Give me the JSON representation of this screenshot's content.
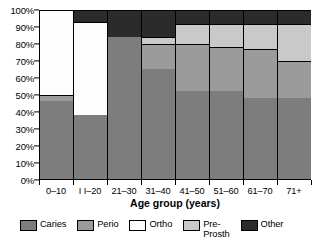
{
  "chart_data": {
    "type": "bar",
    "subtype": "stacked-percentage",
    "title": "",
    "xlabel": "Age group (years)",
    "ylabel": "",
    "categories": [
      "0–10",
      "I I–20",
      "21–30",
      "31–40",
      "41–50",
      "51–60",
      "61–70",
      "71+"
    ],
    "ylim": [
      0,
      100
    ],
    "ytick_labels": [
      "0%",
      "10%",
      "20%",
      "30%",
      "40%",
      "50%",
      "60%",
      "70%",
      "80%",
      "90%",
      "100%"
    ],
    "ytick_values": [
      0,
      10,
      20,
      30,
      40,
      50,
      60,
      70,
      80,
      90,
      100
    ],
    "grid": false,
    "legend_position": "bottom",
    "series": [
      {
        "name": "Caries",
        "color": "#7d7d7d",
        "values": [
          46,
          38,
          84,
          65,
          52,
          52,
          48,
          48
        ]
      },
      {
        "name": "Perio",
        "color": "#9b9b9b",
        "values": [
          4,
          0,
          0,
          15,
          28,
          26,
          29,
          22
        ]
      },
      {
        "name": "Ortho",
        "color": "#fdfdfd",
        "values": [
          50,
          55,
          0,
          0,
          0,
          0,
          0,
          0
        ]
      },
      {
        "name": "Pre-Prosth",
        "color": "#c9c9c9",
        "values": [
          0,
          0,
          0,
          4,
          12,
          14,
          15,
          22
        ]
      },
      {
        "name": "Other",
        "color": "#2b2b2b",
        "values": [
          0,
          7,
          16,
          16,
          8,
          8,
          8,
          8
        ]
      }
    ]
  },
  "legend": {
    "items": [
      {
        "label": "Caries",
        "color": "#7d7d7d"
      },
      {
        "label": "Perio",
        "color": "#9b9b9b"
      },
      {
        "label": "Ortho",
        "color": "#fdfdfd"
      },
      {
        "label": "Pre-\nProsth",
        "color": "#c9c9c9"
      },
      {
        "label": "Other",
        "color": "#2b2b2b"
      }
    ]
  }
}
